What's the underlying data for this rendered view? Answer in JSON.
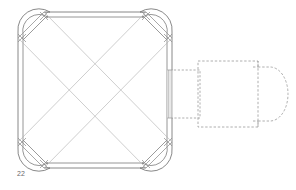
{
  "drawing": {
    "title": "Square plan with corner pavilions and projected annex",
    "figure_label": "22",
    "label_color": "#6a6a6a",
    "background_color": "#ffffff",
    "line_color_solid": "#7b7b7b",
    "line_color_thin": "#b4b4b4",
    "line_color_dashed": "#9a9a9a",
    "hatch_color": "#bcbcbc"
  },
  "main_block": {
    "name": "square-body",
    "outer": {
      "x": 18,
      "y": 12,
      "width": 154,
      "height": 156
    },
    "inner_offset": 5,
    "corner_inset": 26,
    "description": "Double-line square walls with chamfered corners"
  },
  "corner_pavilions": [
    {
      "name": "pavilion-top-left",
      "cx": 32,
      "cy": 26,
      "radius": 17
    },
    {
      "name": "pavilion-top-right",
      "cx": 158,
      "cy": 26,
      "radius": 17
    },
    {
      "name": "pavilion-bottom-left",
      "cx": 32,
      "cy": 154,
      "radius": 17
    },
    {
      "name": "pavilion-bottom-right",
      "cx": 158,
      "cy": 154,
      "radius": 17
    }
  ],
  "diagonals": {
    "name": "vault-ribs",
    "count": 4,
    "description": "Two crossing pairs forming an X over the square interior"
  },
  "opening": {
    "name": "right-wall-opening",
    "x": 168,
    "y": 70,
    "width": 5,
    "height": 48,
    "style": "hatched"
  },
  "annex_small": {
    "name": "annex-small-dashed",
    "x": 172,
    "y": 70,
    "width": 28,
    "height": 48,
    "style": "dashed"
  },
  "annex_large": {
    "name": "annex-large-dashed",
    "x": 198,
    "y": 61,
    "width": 68,
    "height": 66,
    "style": "dashed"
  },
  "annex_cap": {
    "name": "annex-rounded-cap-dashed",
    "x": 263,
    "y": 64,
    "width": 24,
    "height": 60,
    "style": "dashed-rounded"
  }
}
